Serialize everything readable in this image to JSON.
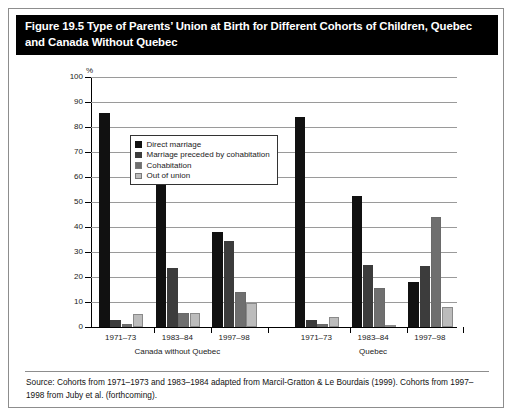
{
  "figure": {
    "title": "Figure 19.5 Type of Parents’ Union at Birth for Different Cohorts of Children, Quebec and Canada Without Quebec",
    "source": "Source: Cohorts from 1971–1973 and 1983–1984 adapted from Marcil-Gratton & Le Bourdais (1999). Cohorts from 1997–1998 from Juby et al. (forthcoming)."
  },
  "chart_data": {
    "type": "bar",
    "title": "Figure 19.5 Type of Parents’ Union at Birth for Different Cohorts of Children, Quebec and Canada Without Quebec",
    "xlabel": "",
    "ylabel": "%",
    "ylim": [
      0,
      100
    ],
    "yticks": [
      0,
      10,
      20,
      30,
      40,
      50,
      60,
      70,
      80,
      90,
      100
    ],
    "grid": true,
    "legend_position": "top-left-inside",
    "categories": [
      "1971–73",
      "1983–84",
      "1997–98",
      "1971–73",
      "1983–84",
      "1997–98"
    ],
    "groups": [
      {
        "label": "Canada without Quebec",
        "categories": [
          "1971–73",
          "1983–84",
          "1997–98"
        ]
      },
      {
        "label": "Quebec",
        "categories": [
          "1971–73",
          "1983–84",
          "1997–98"
        ]
      }
    ],
    "series": [
      {
        "name": "Direct marriage",
        "color": "#111111",
        "values": [
          85.5,
          60.5,
          38.0,
          84.0,
          52.5,
          18.0
        ]
      },
      {
        "name": "Marriage preceded by cohabitation",
        "color": "#3c3c3c",
        "values": [
          2.8,
          23.5,
          34.5,
          3.0,
          25.0,
          24.5
        ]
      },
      {
        "name": "Cohabitation",
        "color": "#6f6f6f",
        "values": [
          1.2,
          5.8,
          14.2,
          1.2,
          15.5,
          44.0
        ]
      },
      {
        "name": "Out of union",
        "color": "#bcbcbc",
        "values": [
          5.3,
          5.8,
          9.5,
          4.2,
          1.0,
          8.0
        ]
      }
    ]
  },
  "legend": {
    "items": [
      {
        "label": "Direct marriage",
        "swatch": "#111111"
      },
      {
        "label": "Marriage preceded by cohabitation",
        "swatch": "#3c3c3c"
      },
      {
        "label": "Cohabitation",
        "swatch": "#6f6f6f"
      },
      {
        "label": "Out of union",
        "swatch": "#bcbcbc"
      }
    ]
  }
}
